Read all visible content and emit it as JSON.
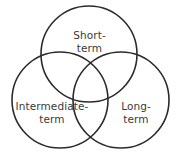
{
  "diagram": {
    "type": "venn-3-circle",
    "background_color": "#ffffff",
    "stroke_color": "#2b2b2b",
    "text_color": "#3a3a3a",
    "sets": [
      {
        "id": "short-term",
        "label_line1": "Short-",
        "label_line2": "term",
        "full_label": "Short-term",
        "position": "top",
        "center_x": 89,
        "center_y": 54,
        "radius": 48
      },
      {
        "id": "intermediate-term",
        "label_line1": "Intermediate-",
        "label_line2": "term",
        "full_label": "Intermediate-term",
        "position": "bottom-left",
        "center_x": 60,
        "center_y": 100,
        "radius": 48
      },
      {
        "id": "long-term",
        "label_line1": "Long-",
        "label_line2": "term",
        "full_label": "Long-term",
        "position": "bottom-right",
        "center_x": 121,
        "center_y": 100,
        "radius": 48
      }
    ]
  }
}
